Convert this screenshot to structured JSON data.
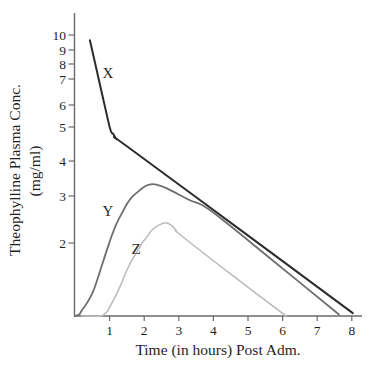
{
  "figure": {
    "background": "#ffffff",
    "axis_color": "#6b6b6b",
    "text_color": "#1f1f1f"
  },
  "chart_data": {
    "type": "line",
    "title": "",
    "xlabel": "Time (in hours) Post Adm.",
    "ylabel_line1": "Theophylline Plasma Conc.",
    "ylabel_line2": "(mg/ml)",
    "x_ticks": [
      1,
      2,
      3,
      4,
      5,
      6,
      7,
      8
    ],
    "y_ticks": [
      10,
      9,
      8,
      7,
      6,
      5,
      4,
      3,
      2
    ],
    "x_range": [
      0,
      8.4
    ],
    "y_scale": "nonlinear (approximately logarithmic, scanned hand-drawn axis)",
    "grid": false,
    "legend": "inline curve labels",
    "series": [
      {
        "name": "X",
        "color": "#2b2b2b",
        "width": 2.0,
        "points": [
          [
            0.43,
            9.65
          ],
          [
            0.72,
            6.79
          ],
          [
            1.01,
            4.97
          ],
          [
            1.1,
            4.8
          ],
          [
            1.2,
            4.65
          ],
          [
            1.45,
            4.47
          ],
          [
            4.74,
            2.3
          ],
          [
            8.03,
            1.04
          ]
        ]
      },
      {
        "name": "Y",
        "color": "#6e6e6e",
        "width": 1.8,
        "points": [
          [
            0,
            1.0
          ],
          [
            0.12,
            1.02
          ],
          [
            0.2,
            1.08
          ],
          [
            0.35,
            1.18
          ],
          [
            0.5,
            1.31
          ],
          [
            0.64,
            1.49
          ],
          [
            0.78,
            1.7
          ],
          [
            0.92,
            1.9
          ],
          [
            1.07,
            2.17
          ],
          [
            1.21,
            2.43
          ],
          [
            1.36,
            2.64
          ],
          [
            1.5,
            2.83
          ],
          [
            1.65,
            2.98
          ],
          [
            1.84,
            3.14
          ],
          [
            2.05,
            3.29
          ],
          [
            2.25,
            3.34
          ],
          [
            2.5,
            3.28
          ],
          [
            2.75,
            3.17
          ],
          [
            3.32,
            2.91
          ],
          [
            3.9,
            2.7
          ],
          [
            5.77,
            1.74
          ],
          [
            7.63,
            1.02
          ]
        ]
      },
      {
        "name": "Z",
        "color": "#bcbcbc",
        "width": 1.6,
        "points": [
          [
            0.2,
            1.0
          ],
          [
            0.75,
            1.0
          ],
          [
            0.85,
            1.03
          ],
          [
            0.93,
            1.06
          ],
          [
            1.07,
            1.18
          ],
          [
            1.21,
            1.31
          ],
          [
            1.36,
            1.47
          ],
          [
            1.5,
            1.63
          ],
          [
            1.65,
            1.77
          ],
          [
            1.79,
            1.88
          ],
          [
            1.94,
            2.0
          ],
          [
            2.08,
            2.13
          ],
          [
            2.23,
            2.28
          ],
          [
            2.4,
            2.37
          ],
          [
            2.6,
            2.43
          ],
          [
            2.78,
            2.38
          ],
          [
            2.92,
            2.27
          ],
          [
            3.05,
            2.17
          ],
          [
            4.57,
            1.55
          ],
          [
            6.1,
            1.0
          ]
        ]
      }
    ],
    "layout": {
      "plot": {
        "axis_x_px": 74.5,
        "axis_top_y_px": 13,
        "baseline_y_px": 316,
        "axis_right_x_px": 362,
        "x_origin_px": 75,
        "px_per_hour": 34.6,
        "y_tick_len_px": 6,
        "x_tick_len_px": 5
      },
      "y_value_to_px": [
        [
          10,
          35
        ],
        [
          9,
          50
        ],
        [
          8,
          64
        ],
        [
          7,
          79
        ],
        [
          6,
          105
        ],
        [
          5,
          127
        ],
        [
          4,
          161
        ],
        [
          3,
          196
        ],
        [
          2,
          243
        ],
        [
          1,
          316
        ]
      ],
      "series_label_px": {
        "X": [
          108,
          78
        ],
        "Y": [
          108,
          216
        ],
        "Z": [
          136,
          254
        ]
      },
      "y_tick_label_right_x": 66,
      "x_tick_label_baseline_y": 335,
      "xlabel_center": [
        218,
        355
      ],
      "ylabel_line1_pos": [
        20,
        170
      ],
      "ylabel_line2_pos": [
        40,
        171
      ]
    }
  }
}
